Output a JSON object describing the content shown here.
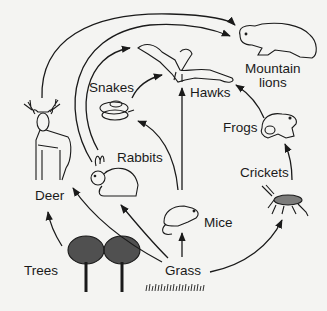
{
  "diagram": {
    "organisms": [
      {
        "id": "trees",
        "label": "Trees"
      },
      {
        "id": "grass",
        "label": "Grass"
      },
      {
        "id": "deer",
        "label": "Deer"
      },
      {
        "id": "rabbits",
        "label": "Rabbits"
      },
      {
        "id": "mice",
        "label": "Mice"
      },
      {
        "id": "crickets",
        "label": "Crickets"
      },
      {
        "id": "snakes",
        "label": "Snakes"
      },
      {
        "id": "frogs",
        "label": "Frogs"
      },
      {
        "id": "hawks",
        "label": "Hawks"
      },
      {
        "id": "mountain_lions",
        "label": "Mountain\nlions",
        "line1": "Mountain",
        "line2": "lions"
      }
    ],
    "arrows": [
      {
        "from": "trees",
        "to": "deer"
      },
      {
        "from": "grass",
        "to": "deer"
      },
      {
        "from": "grass",
        "to": "rabbits"
      },
      {
        "from": "grass",
        "to": "mice"
      },
      {
        "from": "grass",
        "to": "crickets"
      },
      {
        "from": "crickets",
        "to": "frogs"
      },
      {
        "from": "mice",
        "to": "snakes"
      },
      {
        "from": "mice",
        "to": "hawks"
      },
      {
        "from": "snakes",
        "to": "hawks"
      },
      {
        "from": "frogs",
        "to": "hawks"
      },
      {
        "from": "rabbits",
        "to": "hawks"
      },
      {
        "from": "rabbits",
        "to": "mountain_lions"
      },
      {
        "from": "deer",
        "to": "mountain_lions"
      }
    ],
    "colors": {
      "line": "#1a1a1a",
      "background": "#f4f4f2"
    }
  }
}
